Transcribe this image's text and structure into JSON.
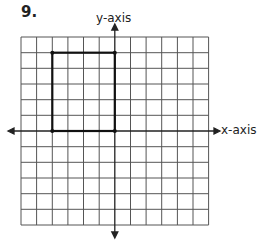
{
  "problem_number": "9.",
  "axes": {
    "x_label": "x-axis",
    "y_label": "y-axis"
  },
  "grid": {
    "columns": 12,
    "rows": 12,
    "x_range": [
      -6,
      6
    ],
    "y_range": [
      -6,
      6
    ]
  },
  "figure": {
    "shape": "rectangle",
    "vertices": [
      [
        -4,
        5
      ],
      [
        0,
        5
      ],
      [
        0,
        0
      ],
      [
        -4,
        0
      ]
    ]
  }
}
